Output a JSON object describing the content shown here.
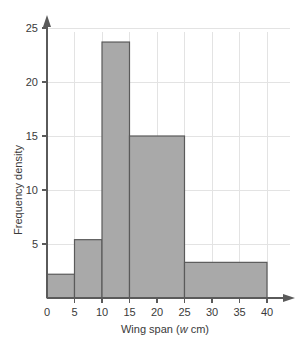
{
  "chart_data": {
    "type": "bar",
    "title": "",
    "subtitle": "",
    "xlabel": "Wing span (w cm)",
    "xlabel_symbol": "w",
    "xlabel_prefix": "Wing span (",
    "xlabel_suffix": " cm)",
    "ylabel": "Frequency density",
    "xlim": [
      0,
      40
    ],
    "ylim": [
      0,
      27
    ],
    "xticks": [
      0,
      5,
      10,
      15,
      20,
      25,
      30,
      35,
      40
    ],
    "xtick_labels": [
      "0",
      "5",
      "10",
      "15",
      "20",
      "25",
      "30",
      "35",
      "40"
    ],
    "yticks": [
      5,
      10,
      15,
      20,
      25
    ],
    "ytick_labels": [
      "5",
      "10",
      "15",
      "20",
      "25"
    ],
    "grid": true,
    "legend": "none",
    "bar_fill_color": "#a9a9a9",
    "bar_edge_color": "#5a5a5a",
    "grid_color": "#e3e3e3",
    "axis_color": "#5a5a5a",
    "bins": [
      {
        "label": "0-5",
        "x0": 0,
        "x1": 5,
        "value": 2.2
      },
      {
        "label": "5-10",
        "x0": 5,
        "x1": 10,
        "value": 5.4
      },
      {
        "label": "10-15",
        "x0": 10,
        "x1": 15,
        "value": 23.7
      },
      {
        "label": "15-25",
        "x0": 15,
        "x1": 25,
        "value": 15.0
      },
      {
        "label": "25-40",
        "x0": 25,
        "x1": 40,
        "value": 3.3
      }
    ],
    "categories": [
      "0-5",
      "5-10",
      "10-15",
      "15-25",
      "25-40"
    ],
    "values": [
      2.2,
      5.4,
      23.7,
      15.0,
      3.3
    ]
  }
}
